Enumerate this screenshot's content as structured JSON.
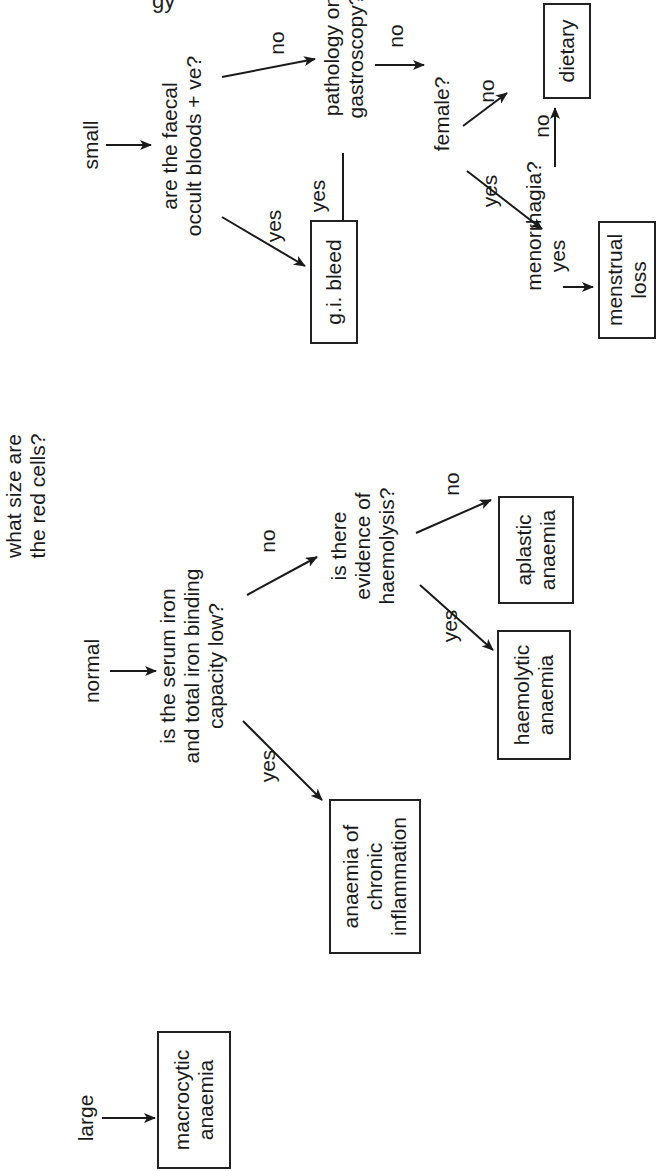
{
  "page": {
    "header_fragment": "gy"
  },
  "diagram": {
    "type": "decision-tree",
    "orientation": "rotated -90deg (text reads bottom-to-top)",
    "root": {
      "id": "root",
      "text": "what size are\nthe red cells?",
      "lines": [
        "what size are",
        "the red cells?"
      ]
    },
    "branches": [
      {
        "id": "large",
        "label": "large"
      },
      {
        "id": "normal",
        "label": "normal"
      },
      {
        "id": "small",
        "label": "small"
      }
    ],
    "questions": {
      "serum_iron": {
        "lines": [
          "is the serum iron",
          "and total iron binding",
          "capacity low?"
        ]
      },
      "haemolysis": {
        "lines": [
          "is there",
          "evidence of",
          "haemolysis?"
        ]
      },
      "faecal": {
        "lines": [
          "are the faecal",
          "occult bloods + ve?"
        ]
      },
      "gastroscopy": {
        "lines": [
          "pathology on",
          "gastroscopy?"
        ]
      },
      "female": {
        "lines": [
          "female?"
        ]
      },
      "menorrhagia": {
        "lines": [
          "menorrhagia?"
        ]
      }
    },
    "outcomes": {
      "macrocytic": {
        "lines": [
          "macrocytic",
          "anaemia"
        ]
      },
      "chronic": {
        "lines": [
          "anaemia of",
          "chronic",
          "inflammation"
        ]
      },
      "haemolytic": {
        "lines": [
          "haemolytic",
          "anaemia"
        ]
      },
      "aplastic": {
        "lines": [
          "aplastic",
          "anaemia"
        ]
      },
      "gi_bleed": {
        "lines": [
          "g.i. bleed"
        ]
      },
      "menstrual": {
        "lines": [
          "menstrual",
          "loss"
        ]
      },
      "dietary": {
        "lines": [
          "dietary"
        ]
      }
    },
    "edge_labels": {
      "yes": "yes",
      "no": "no"
    },
    "edges": [
      {
        "from": "large",
        "to": "macrocytic",
        "label": ""
      },
      {
        "from": "normal",
        "to": "serum_iron",
        "label": ""
      },
      {
        "from": "serum_iron",
        "to": "chronic",
        "label": "yes"
      },
      {
        "from": "serum_iron",
        "to": "haemolysis",
        "label": "no"
      },
      {
        "from": "haemolysis",
        "to": "haemolytic",
        "label": "yes"
      },
      {
        "from": "haemolysis",
        "to": "aplastic",
        "label": "no"
      },
      {
        "from": "small",
        "to": "faecal",
        "label": ""
      },
      {
        "from": "faecal",
        "to": "gi_bleed",
        "label": "yes"
      },
      {
        "from": "faecal",
        "to": "gastroscopy",
        "label": "no"
      },
      {
        "from": "gastroscopy",
        "to": "gi_bleed",
        "label": "yes"
      },
      {
        "from": "gastroscopy",
        "to": "female",
        "label": "no"
      },
      {
        "from": "female",
        "to": "menorrhagia",
        "label": "yes"
      },
      {
        "from": "female",
        "to": "dietary",
        "label": "no"
      },
      {
        "from": "menorrhagia",
        "to": "menstrual",
        "label": "yes"
      },
      {
        "from": "menorrhagia",
        "to": "dietary",
        "label": "no"
      }
    ]
  }
}
